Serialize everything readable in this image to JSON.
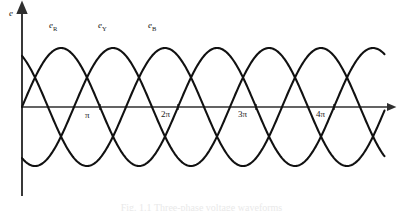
{
  "figure": {
    "kind": "three-phase-emf-waveform-diagram",
    "y_axis_label": "e",
    "caption": "Fig. 1.1  Three-phase voltage waveforms",
    "background_color": "#ffffff",
    "curve_color": "#111111",
    "axis_color": "#3a3a3a"
  },
  "curve_labels": [
    {
      "id": "eR",
      "text": "e",
      "sub": "R",
      "x_px": 49,
      "y_px": 21
    },
    {
      "id": "eY",
      "text": "e",
      "sub": "Y",
      "x_px": 98,
      "y_px": 21
    },
    {
      "id": "eB",
      "text": "e",
      "sub": "B",
      "x_px": 148,
      "y_px": 21
    }
  ],
  "x_ticks": [
    {
      "label": "π",
      "value": 3.14159,
      "x_px": 100
    },
    {
      "label": "2π",
      "value": 6.28319,
      "x_px": 178
    },
    {
      "label": "3π",
      "value": 9.42478,
      "x_px": 256
    },
    {
      "label": "4π",
      "value": 12.56637,
      "x_px": 334
    }
  ],
  "chart_data": {
    "type": "line",
    "title": "",
    "subtitle": "",
    "xlabel": "",
    "ylabel": "e",
    "grid": false,
    "legend": "inline-curve-labels",
    "x_unit": "radians",
    "xlim": [
      0,
      14.6
    ],
    "ylim": [
      -1.12,
      1.12
    ],
    "x_tick_labels": [
      "π",
      "2π",
      "3π",
      "4π"
    ],
    "x_tick_values": [
      3.14159,
      6.28319,
      9.42478,
      12.56637
    ],
    "y_tick_labels": [],
    "amplitude": 1.0,
    "period_radians": 6.28319,
    "series": [
      {
        "name": "eR",
        "label": "e_R",
        "phase_deg": 0,
        "formula": "e_R = Em sin(θ)",
        "color": "#111111",
        "x": [
          0,
          0.7854,
          1.5708,
          2.3562,
          3.14159,
          3.92699,
          4.71239,
          5.49779,
          6.28319,
          7.06858,
          7.85398,
          8.63938,
          9.42478,
          10.21018,
          10.99557,
          11.78097,
          12.56637,
          13.35177,
          14.13717,
          14.6
        ],
        "y": [
          0,
          0.7071,
          1.0,
          0.7071,
          0,
          -0.7071,
          -1.0,
          -0.7071,
          0,
          0.7071,
          1.0,
          0.7071,
          0,
          -0.7071,
          -1.0,
          -0.7071,
          0,
          0.7071,
          1.0,
          0.9048
        ]
      },
      {
        "name": "eY",
        "label": "e_Y",
        "phase_deg": -120,
        "formula": "e_Y = Em sin(θ - 120°)",
        "color": "#111111",
        "x": [
          0,
          0.7854,
          1.5708,
          2.3562,
          3.14159,
          3.92699,
          4.71239,
          5.49779,
          6.28319,
          7.06858,
          7.85398,
          8.63938,
          9.42478,
          10.21018,
          10.99557,
          11.78097,
          12.56637,
          13.35177,
          14.13717,
          14.6
        ],
        "y": [
          -0.866,
          -0.2588,
          0.5,
          0.9659,
          0.866,
          0.2588,
          -0.5,
          -0.9659,
          -0.866,
          -0.2588,
          0.5,
          0.9659,
          0.866,
          0.2588,
          -0.5,
          -0.9659,
          -0.866,
          -0.2588,
          0.5,
          0.7431
        ]
      },
      {
        "name": "eB",
        "label": "e_B",
        "phase_deg": 120,
        "formula": "e_B = Em sin(θ + 120°)",
        "color": "#111111",
        "x": [
          0,
          0.7854,
          1.5708,
          2.3562,
          3.14159,
          3.92699,
          4.71239,
          5.49779,
          6.28319,
          7.06858,
          7.85398,
          8.63938,
          9.42478,
          10.21018,
          10.99557,
          11.78097,
          12.56637,
          13.35177,
          14.13717,
          14.6
        ],
        "y": [
          0.866,
          0.9659,
          0.5,
          -0.2588,
          -0.866,
          -0.9659,
          -0.5,
          0.2588,
          0.866,
          0.9659,
          0.5,
          -0.2588,
          -0.866,
          -0.9659,
          -0.5,
          0.2588,
          0.866,
          0.9659,
          0.5,
          0.1564
        ]
      }
    ],
    "annotations": [
      {
        "text": "e",
        "role": "y-axis-label"
      },
      {
        "text": "e_R",
        "role": "curve-label"
      },
      {
        "text": "e_Y",
        "role": "curve-label"
      },
      {
        "text": "e_B",
        "role": "curve-label"
      }
    ]
  }
}
